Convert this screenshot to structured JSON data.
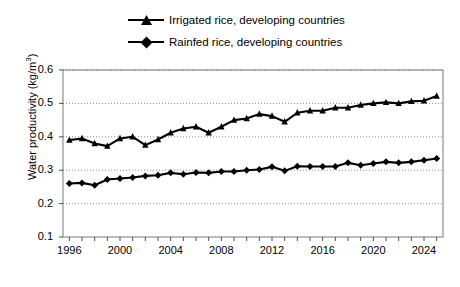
{
  "chart_data": {
    "type": "line",
    "title": "",
    "xlabel": "",
    "ylabel": "Water productivity (kg/m3)",
    "ylabel_text": "Water productivity (kg/m",
    "ylabel_sup": "3",
    "ylabel_tail": ")",
    "xlim": [
      1995.5,
      2025.5
    ],
    "ylim": [
      0.1,
      0.6
    ],
    "yticks": [
      "0.1",
      "0.2",
      "0.3",
      "0.4",
      "0.5",
      "0.6"
    ],
    "ytick_values": [
      0.1,
      0.2,
      0.3,
      0.4,
      0.5,
      0.6
    ],
    "xticks": [
      "1996",
      "2000",
      "2004",
      "2008",
      "2012",
      "2016",
      "2020",
      "2024"
    ],
    "xtick_values": [
      1996,
      2000,
      2004,
      2008,
      2012,
      2016,
      2020,
      2024
    ],
    "x": [
      1996,
      1997,
      1998,
      1999,
      2000,
      2001,
      2002,
      2003,
      2004,
      2005,
      2006,
      2007,
      2008,
      2009,
      2010,
      2011,
      2012,
      2013,
      2014,
      2015,
      2016,
      2017,
      2018,
      2019,
      2020,
      2021,
      2022,
      2023,
      2024,
      2025
    ],
    "grid": "horizontal-dotted",
    "legend_position": "top-center",
    "series": [
      {
        "name": "Irrigated rice, developing countries",
        "marker": "triangle",
        "color": "#000000",
        "values": [
          0.39,
          0.395,
          0.38,
          0.372,
          0.395,
          0.4,
          0.375,
          0.392,
          0.412,
          0.425,
          0.43,
          0.412,
          0.43,
          0.45,
          0.455,
          0.468,
          0.462,
          0.445,
          0.472,
          0.478,
          0.478,
          0.487,
          0.487,
          0.495,
          0.5,
          0.503,
          0.5,
          0.506,
          0.508,
          0.522
        ]
      },
      {
        "name": "Rainfed rice, developing countries",
        "marker": "diamond",
        "color": "#000000",
        "values": [
          0.26,
          0.262,
          0.255,
          0.272,
          0.275,
          0.278,
          0.283,
          0.285,
          0.292,
          0.288,
          0.293,
          0.292,
          0.296,
          0.296,
          0.3,
          0.302,
          0.31,
          0.298,
          0.312,
          0.311,
          0.311,
          0.311,
          0.322,
          0.315,
          0.32,
          0.325,
          0.322,
          0.325,
          0.33,
          0.335
        ]
      }
    ]
  },
  "legend": {
    "entries": [
      {
        "label": "Irrigated rice, developing countries",
        "marker": "triangle"
      },
      {
        "label": "Rainfed rice, developing countries",
        "marker": "diamond"
      }
    ]
  }
}
